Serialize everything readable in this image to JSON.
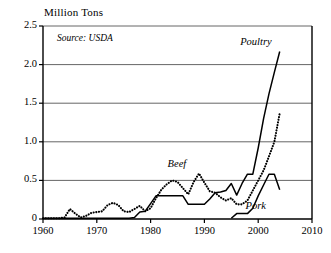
{
  "chart_data": {
    "type": "line",
    "title": "Million Tons",
    "subtitle": "",
    "xlabel": "",
    "ylabel": "Million Tons",
    "annotation": "Source: USDA",
    "xlim": [
      1960,
      2010
    ],
    "ylim": [
      0,
      2.5
    ],
    "grid": true,
    "legend_position": "inline-labels",
    "xticks": [
      "1960",
      "1970",
      "1980",
      "1990",
      "2000",
      "2010"
    ],
    "xtick_values": [
      1960,
      1970,
      1980,
      1990,
      2000,
      2010
    ],
    "yticks": [
      "0",
      "0.5",
      "1.0",
      "1.5",
      "2.0",
      "2.5"
    ],
    "ytick_values": [
      0,
      0.5,
      1.0,
      1.5,
      2.0,
      2.5
    ],
    "series": [
      {
        "name": "Poultry",
        "style": "solid",
        "color": "#000000",
        "x": [
          1960,
          1961,
          1962,
          1963,
          1964,
          1965,
          1966,
          1967,
          1968,
          1969,
          1970,
          1971,
          1972,
          1973,
          1974,
          1975,
          1976,
          1977,
          1978,
          1979,
          1980,
          1981,
          1982,
          1983,
          1984,
          1985,
          1986,
          1987,
          1988,
          1989,
          1990,
          1991,
          1992,
          1993,
          1994,
          1995,
          1996,
          1997,
          1998,
          1999,
          2000,
          2001,
          2002,
          2003,
          2004
        ],
        "values": [
          0.01,
          0.01,
          0.01,
          0.01,
          0.01,
          0.01,
          0.01,
          0.01,
          0.01,
          0.01,
          0.01,
          0.01,
          0.01,
          0.01,
          0.01,
          0.01,
          0.01,
          0.02,
          0.09,
          0.1,
          0.2,
          0.3,
          0.3,
          0.3,
          0.3,
          0.3,
          0.3,
          0.19,
          0.19,
          0.19,
          0.19,
          0.26,
          0.34,
          0.35,
          0.37,
          0.46,
          0.31,
          0.46,
          0.58,
          0.58,
          0.92,
          1.3,
          1.62,
          1.9,
          2.17
        ]
      },
      {
        "name": "Beef",
        "style": "dotted",
        "color": "#000000",
        "x": [
          1960,
          1961,
          1962,
          1963,
          1964,
          1965,
          1966,
          1967,
          1968,
          1969,
          1970,
          1971,
          1972,
          1973,
          1974,
          1975,
          1976,
          1977,
          1978,
          1979,
          1980,
          1981,
          1982,
          1983,
          1984,
          1985,
          1986,
          1987,
          1988,
          1989,
          1990,
          1991,
          1992,
          1993,
          1994,
          1995,
          1996,
          1997,
          1998,
          1999,
          2000,
          2001,
          2002,
          2003,
          2004
        ],
        "values": [
          0.01,
          0.01,
          0.01,
          0.01,
          0.02,
          0.13,
          0.07,
          0.02,
          0.04,
          0.08,
          0.09,
          0.1,
          0.18,
          0.21,
          0.18,
          0.1,
          0.09,
          0.13,
          0.17,
          0.1,
          0.14,
          0.27,
          0.38,
          0.45,
          0.5,
          0.48,
          0.4,
          0.32,
          0.48,
          0.59,
          0.47,
          0.36,
          0.34,
          0.28,
          0.24,
          0.27,
          0.19,
          0.19,
          0.24,
          0.37,
          0.5,
          0.63,
          0.81,
          1.0,
          1.37
        ]
      },
      {
        "name": "Pork",
        "style": "solid",
        "color": "#000000",
        "x": [
          1995,
          1996,
          1997,
          1998,
          1999,
          2000,
          2001,
          2002,
          2003,
          2004
        ],
        "values": [
          0.01,
          0.07,
          0.07,
          0.07,
          0.14,
          0.3,
          0.44,
          0.58,
          0.58,
          0.38
        ]
      }
    ],
    "series_label_positions": [
      {
        "name": "Poultry",
        "x": 2000.0,
        "y": 2.28
      },
      {
        "name": "Beef",
        "x": 1986.5,
        "y": 0.7
      },
      {
        "name": "Pork",
        "x": 2001.0,
        "y": 0.16
      }
    ]
  },
  "axes": {
    "y_title": "Million Tons",
    "source": "Source: USDA"
  }
}
